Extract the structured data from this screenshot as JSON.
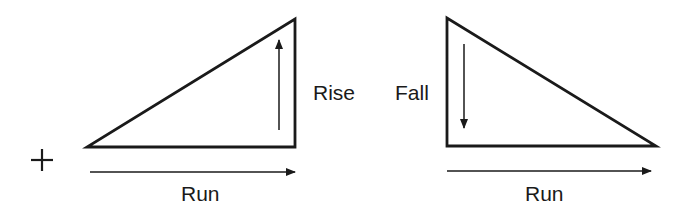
{
  "diagram": {
    "plus_sign": "+",
    "left": {
      "shape": "right-triangle-rising",
      "vertical_label": "Rise",
      "horizontal_label": "Run",
      "vertical_arrow_direction": "up",
      "horizontal_arrow_direction": "right"
    },
    "right": {
      "shape": "right-triangle-falling",
      "vertical_label": "Fall",
      "horizontal_label": "Run",
      "vertical_arrow_direction": "down",
      "horizontal_arrow_direction": "right"
    },
    "colors": {
      "stroke": "#1a1a1a",
      "background": "#ffffff"
    }
  }
}
